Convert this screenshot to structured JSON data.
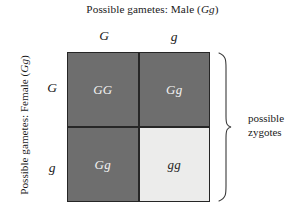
{
  "figure": {
    "title_top": {
      "prefix": "Possible gametes: Male (",
      "allele": "Gg",
      "suffix": ")"
    },
    "title_left": {
      "prefix": "Possible gametes: Female (",
      "allele": "Gg",
      "suffix": ")"
    },
    "column_headers": [
      {
        "label": "G",
        "name": "dominant-allele"
      },
      {
        "label": "g",
        "name": "recessive-allele"
      }
    ],
    "row_headers": [
      {
        "label": "G",
        "name": "dominant-allele"
      },
      {
        "label": "g",
        "name": "recessive-allele"
      }
    ],
    "cells": [
      {
        "label": "GG",
        "shade": "dark",
        "row": 0,
        "col": 0
      },
      {
        "label": "Gg",
        "shade": "dark",
        "row": 0,
        "col": 1
      },
      {
        "label": "Gg",
        "shade": "dark",
        "row": 1,
        "col": 0
      },
      {
        "label": "gg",
        "shade": "light",
        "row": 1,
        "col": 1
      }
    ],
    "bracket_caption": {
      "line1": "possible",
      "line2": "zygotes"
    },
    "colors": {
      "dark_cell": "#6e6e6e",
      "light_cell": "#ececeb",
      "grid_line": "#262626",
      "dark_cell_text": "#f2f2f2",
      "light_cell_text": "#1f1f1f",
      "label_text": "#1a1a1a",
      "background": "#ffffff"
    }
  }
}
